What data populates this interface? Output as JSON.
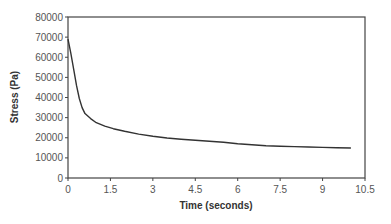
{
  "chart_data": {
    "type": "line",
    "title": "",
    "xlabel": "Time (seconds)",
    "ylabel": "Stress (Pa)",
    "xlim": [
      0,
      10.5
    ],
    "ylim": [
      0,
      80000
    ],
    "xticks": [
      0,
      1.5,
      3,
      4.5,
      6,
      7.5,
      9,
      10.5
    ],
    "xtick_labels": [
      "0",
      "1.5",
      "3",
      "4.5",
      "6",
      "7.5",
      "9",
      "10.5"
    ],
    "yticks": [
      0,
      10000,
      20000,
      30000,
      40000,
      50000,
      60000,
      70000,
      80000
    ],
    "ytick_labels": [
      "0",
      "10000",
      "20000",
      "30000",
      "40000",
      "50000",
      "60000",
      "70000",
      "80000"
    ],
    "grid": false,
    "legend": null,
    "series": [
      {
        "name": "Stress",
        "color": "#333333",
        "x": [
          0,
          0.1,
          0.2,
          0.3,
          0.4,
          0.5,
          0.6,
          0.8,
          1.0,
          1.3,
          1.6,
          2.0,
          2.5,
          3.0,
          3.5,
          4.0,
          4.5,
          5.0,
          5.5,
          6.0,
          6.5,
          7.0,
          7.5,
          8.0,
          8.5,
          9.0,
          9.5,
          10.0
        ],
        "values": [
          69000,
          62000,
          54000,
          46000,
          39500,
          35000,
          32000,
          29500,
          27500,
          25800,
          24500,
          23200,
          21800,
          20700,
          19900,
          19300,
          18800,
          18300,
          17800,
          17000,
          16500,
          16000,
          15800,
          15600,
          15400,
          15200,
          15000,
          14900
        ]
      }
    ]
  }
}
